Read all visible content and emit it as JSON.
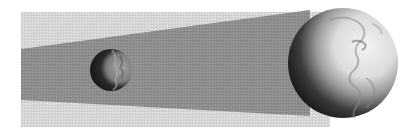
{
  "illustration": {
    "subject": "Earth's shadow falling on the Moon (lunar eclipse)",
    "colors": {
      "background": "#ffffff",
      "penumbra": "#d4d4d4",
      "umbra": "#8c8c8c",
      "moon_dark": "#1e1e1e",
      "moon_lit": "#8f8f8f",
      "earth_dark": "#111111",
      "earth_lit": "#e2e2e2"
    },
    "penumbra": {
      "x1": 21,
      "x2": 330,
      "top": 12,
      "bottom": 127
    },
    "umbra": {
      "left_top": 49,
      "left_bottom": 100,
      "right_x": 310,
      "right_top": 10,
      "right_bottom": 116
    },
    "moon": {
      "cx": 111,
      "cy": 70,
      "r": 21
    },
    "earth": {
      "cx": 343,
      "cy": 63,
      "r": 55
    }
  }
}
